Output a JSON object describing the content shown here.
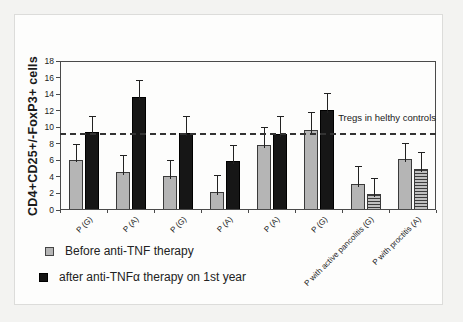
{
  "chart_data": {
    "type": "bar",
    "title": "",
    "ylabel": "CD4+CD25+/-FoxP3+ cells",
    "xlabel": "",
    "ylim": [
      0,
      18
    ],
    "yticks": [
      0,
      2,
      4,
      6,
      8,
      10,
      12,
      14,
      16,
      18
    ],
    "grid": false,
    "legend_position": "bottom-left",
    "categories": [
      "P (G)",
      "P (A)",
      "P (G)",
      "P (A)",
      "P (A)",
      "P (G)",
      "P with active pancolitis (G)",
      "P with proctitis (A)"
    ],
    "series": [
      {
        "name": "Before anti-TNF therapy",
        "values": [
          6.1,
          4.6,
          4.1,
          2.2,
          7.9,
          9.7,
          3.2,
          6.2
        ],
        "errors_up": [
          1.9,
          2.0,
          2.0,
          2.0,
          2.1,
          2.1,
          2.1,
          1.9
        ],
        "styles": [
          "gray",
          "gray",
          "gray",
          "gray",
          "gray",
          "gray",
          "gray",
          "gray"
        ]
      },
      {
        "name": "after anti-TNFα therapy on 1st year",
        "values": [
          9.4,
          13.7,
          9.3,
          5.9,
          9.2,
          12.1,
          1.9,
          4.9
        ],
        "errors_up": [
          2.0,
          2.0,
          2.1,
          2.0,
          2.1,
          2.0,
          2.0,
          2.1
        ],
        "styles": [
          "black",
          "black",
          "black",
          "black",
          "black",
          "black",
          "hatched",
          "hatched"
        ]
      }
    ],
    "reference_line": {
      "value": 9.2,
      "label": "Tregs in helthy controls"
    },
    "colors": {
      "before_bar": "#b5b5b5",
      "after_bar": "#161616",
      "hatch_background": "#c0c0c0",
      "hatch_line": "#3c3c3c",
      "frame": "#4a4a4a",
      "reference_line": "#333333"
    }
  },
  "legend": {
    "before_label": "Before anti-TNF therapy",
    "after_label": "after anti-TNFα therapy on 1st year"
  }
}
